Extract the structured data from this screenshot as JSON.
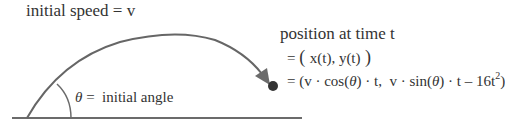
{
  "labels": {
    "initial_speed": "initial speed = v",
    "theta_symbol": "θ",
    "initial_angle_text": " =  initial angle",
    "position_title": "position at time t",
    "position_line1": {
      "eq": "= ",
      "paren_open": "( ",
      "body": "x(t), y(t)",
      "paren_close": " )"
    },
    "position_line2": {
      "eq": "= ",
      "part1": "(v · cos(",
      "theta1": "θ",
      "part2": ") · t,  v · sin(",
      "theta2": "θ",
      "part3": ") · t – 16t",
      "exponent": "2",
      "part4": ")"
    }
  },
  "colors": {
    "stroke": "#666666",
    "text": "#333333",
    "dot": "#333333"
  }
}
